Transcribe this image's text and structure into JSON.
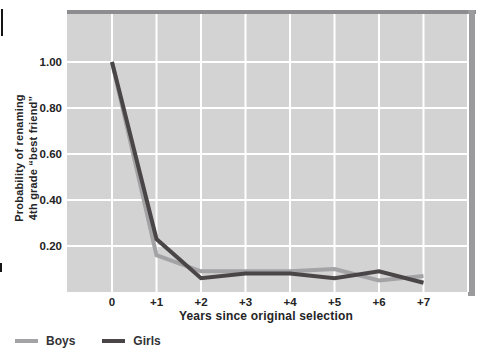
{
  "chart_data": {
    "type": "line",
    "categories": [
      "0",
      "+1",
      "+2",
      "+3",
      "+4",
      "+5",
      "+6",
      "+7"
    ],
    "series": [
      {
        "name": "Boys",
        "color": "#a3a3a5",
        "values": [
          1.0,
          0.16,
          0.09,
          0.09,
          0.09,
          0.1,
          0.05,
          0.07
        ]
      },
      {
        "name": "Girls",
        "color": "#4a4648",
        "values": [
          1.0,
          0.23,
          0.06,
          0.08,
          0.08,
          0.06,
          0.09,
          0.04
        ]
      }
    ],
    "title": "",
    "xlabel": "Years since original selection",
    "ylabel_line1": "Probability of renaming",
    "ylabel_line2": "4th grade “best friend”",
    "y_ticks": [
      0.2,
      0.4,
      0.6,
      0.8,
      1.0
    ],
    "y_tick_labels": [
      "0.20",
      "0.40",
      "0.60",
      "0.80",
      "1.00"
    ],
    "ylim": [
      0,
      1.21
    ],
    "grid": true,
    "legend_position": "bottom-left"
  },
  "colors": {
    "plot_background": "#d3d3d4",
    "gridline": "#ffffff",
    "frame_top": "#8d8d8f",
    "frame_right": "#9b9b9d",
    "text": "#242426"
  }
}
